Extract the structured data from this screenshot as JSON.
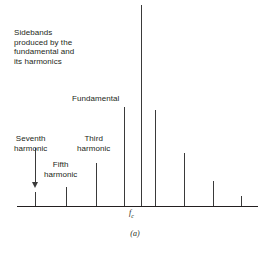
{
  "figure": {
    "caption": "(a)",
    "carrier_axis_label_main": "f",
    "carrier_axis_label_sub": "c"
  },
  "annotations": {
    "sidebands_note": "Sidebands\nproduced by the\nfundamental and\nits harmonics",
    "fundamental": "Fundamental",
    "seventh_harmonic": "Seventh\nharmonic",
    "fifth_harmonic": "Fifth\nharmonic",
    "third_harmonic": "Third\nharmonic"
  },
  "chart_data": {
    "type": "bar",
    "title": "",
    "subtitle": "(a)",
    "xlabel": "",
    "ylabel": "",
    "grid": false,
    "legend": null,
    "axis": {
      "baseline_y_px": 206,
      "x_start_px": 17,
      "x_end_px": 258,
      "x_tick_labels": [
        "f_c"
      ],
      "x_tick_positions_px": [
        141
      ]
    },
    "categories": [
      "7th harmonic sideband (lower)",
      "5th harmonic sideband (lower)",
      "3rd harmonic sideband (lower)",
      "Fundamental sideband (lower)",
      "Carrier fc",
      "Fundamental sideband (upper)",
      "3rd harmonic sideband (upper)",
      "5th harmonic sideband (upper)",
      "7th harmonic sideband (upper)"
    ],
    "x_px": [
      35,
      66,
      96,
      124,
      141,
      155,
      184,
      213,
      241
    ],
    "top_y_px": [
      192,
      187,
      163,
      107,
      5,
      110,
      153,
      181,
      196
    ],
    "values": [
      14,
      19,
      43,
      99,
      201,
      96,
      53,
      25,
      10
    ],
    "ylim": [
      0,
      210
    ],
    "series": [
      {
        "name": "Spectral amplitude",
        "values": [
          14,
          19,
          43,
          99,
          201,
          96,
          53,
          25,
          10
        ]
      }
    ]
  }
}
